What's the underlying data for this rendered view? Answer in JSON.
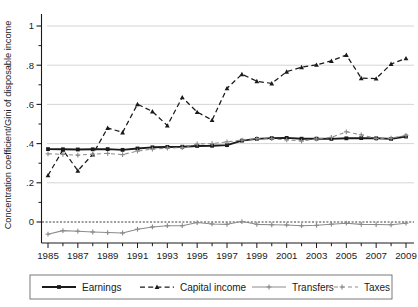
{
  "chart_data": {
    "type": "line",
    "title": "",
    "xlabel": "",
    "ylabel": "Concentration coefficient/Gini of disposable income",
    "xlim": [
      1985,
      2009
    ],
    "ylim": [
      -0.12,
      1.06
    ],
    "yticks": [
      0,
      0.2,
      0.4,
      0.6,
      0.8,
      1
    ],
    "ytick_labels": [
      "0",
      ".2",
      ".4",
      ".6",
      ".8",
      "1"
    ],
    "grid": "horizontal-major",
    "zero_line": true,
    "legend_position": "bottom",
    "x": [
      1985,
      1986,
      1987,
      1988,
      1989,
      1990,
      1991,
      1992,
      1993,
      1994,
      1995,
      1996,
      1997,
      1998,
      1999,
      2000,
      2001,
      2002,
      2003,
      2004,
      2005,
      2006,
      2007,
      2008,
      2009
    ],
    "xticks": [
      1985,
      1986,
      1987,
      1988,
      1989,
      1990,
      1991,
      1992,
      1993,
      1994,
      1995,
      1996,
      1997,
      1998,
      1999,
      2000,
      2001,
      2002,
      2003,
      2004,
      2005,
      2006,
      2007,
      2008,
      2009
    ],
    "xtick_labels": [
      "1985",
      "",
      "1987",
      "",
      "1989",
      "",
      "1991",
      "",
      "1993",
      "",
      "1995",
      "",
      "1997",
      "",
      "1999",
      "",
      "2001",
      "",
      "2003",
      "",
      "2005",
      "",
      "2007",
      "",
      "2009"
    ],
    "series": [
      {
        "name": "Earnings",
        "color": "#1a1a1a",
        "style": "solid",
        "marker": "square",
        "values": [
          0.372,
          0.371,
          0.37,
          0.371,
          0.372,
          0.368,
          0.375,
          0.381,
          0.383,
          0.384,
          0.388,
          0.389,
          0.392,
          0.415,
          0.424,
          0.428,
          0.429,
          0.425,
          0.425,
          0.424,
          0.427,
          0.428,
          0.427,
          0.424,
          0.436
        ]
      },
      {
        "name": "Capital income",
        "color": "#1a1a1a",
        "style": "dashed",
        "marker": "triangle",
        "values": [
          0.238,
          0.368,
          0.262,
          0.345,
          0.48,
          0.457,
          0.601,
          0.564,
          0.492,
          0.636,
          0.561,
          0.52,
          0.682,
          0.754,
          0.718,
          0.707,
          0.767,
          0.79,
          0.802,
          0.822,
          0.852,
          0.734,
          0.732,
          0.806,
          0.835
        ]
      },
      {
        "name": "Transfers",
        "color": "#8c8c8c",
        "style": "solid",
        "marker": "plus",
        "values": [
          -0.062,
          -0.044,
          -0.047,
          -0.051,
          -0.054,
          -0.056,
          -0.037,
          -0.025,
          -0.019,
          -0.019,
          -0.003,
          -0.01,
          -0.012,
          0.002,
          -0.012,
          -0.014,
          -0.015,
          -0.019,
          -0.017,
          -0.011,
          -0.006,
          -0.012,
          -0.013,
          -0.014,
          -0.006
        ]
      },
      {
        "name": "Taxes",
        "color": "#8c8c8c",
        "style": "dashed",
        "marker": "plus",
        "values": [
          0.348,
          0.345,
          0.341,
          0.346,
          0.35,
          0.344,
          0.362,
          0.372,
          0.377,
          0.379,
          0.398,
          0.4,
          0.409,
          0.418,
          0.425,
          0.425,
          0.419,
          0.413,
          0.424,
          0.432,
          0.46,
          0.445,
          0.426,
          0.428,
          0.442
        ]
      }
    ]
  },
  "legend": {
    "items": [
      {
        "label": "Earnings"
      },
      {
        "label": "Capital income"
      },
      {
        "label": "Transfers"
      },
      {
        "label": "Taxes"
      }
    ]
  }
}
